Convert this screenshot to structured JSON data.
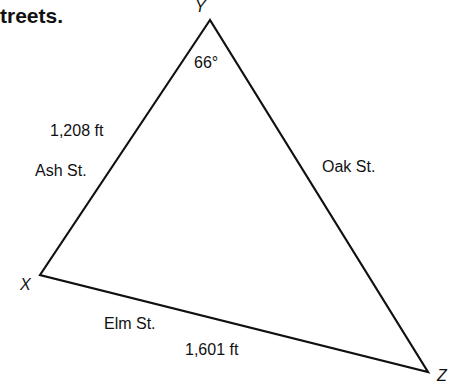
{
  "header": {
    "text": "treets."
  },
  "diagram": {
    "vertices": {
      "x": "X",
      "y": "Y",
      "z": "Z"
    },
    "angle_y": "66°",
    "sides": {
      "ash": {
        "name": "Ash St.",
        "length": "1,208 ft"
      },
      "oak": {
        "name": "Oak St."
      },
      "elm": {
        "name": "Elm St.",
        "length": "1,601 ft"
      }
    }
  }
}
